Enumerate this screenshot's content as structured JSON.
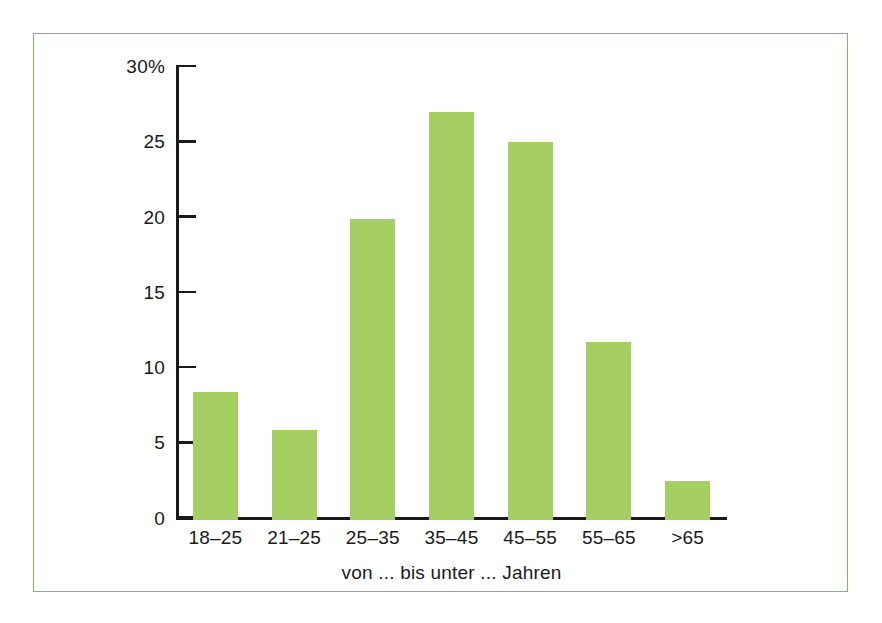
{
  "figure": {
    "frame_color": "#7cbf50",
    "background": "#ffffff"
  },
  "chart_data": {
    "type": "bar",
    "title": "",
    "subtitle": "",
    "xlabel": "von ... bis unter ... Jahren",
    "ylabel": "",
    "categories": [
      "18–25",
      "21–25",
      "25–35",
      "35–45",
      "45–55",
      "55–65",
      ">65"
    ],
    "values": [
      8.5,
      6.0,
      20.0,
      27.1,
      25.1,
      11.8,
      2.6
    ],
    "series": [
      {
        "name": "Anteil",
        "values": [
          8.5,
          6.0,
          20.0,
          27.1,
          25.1,
          11.8,
          2.6
        ]
      }
    ],
    "ylim": [
      0,
      30
    ],
    "ytick_values": [
      0,
      5,
      10,
      15,
      20,
      25,
      30
    ],
    "ytick_labels": [
      "0",
      "5",
      "10",
      "15",
      "20",
      "25",
      "30%"
    ],
    "grid": false,
    "legend": null,
    "bar_color": "#a5ce63",
    "axis_color": "#1a1a1a",
    "unit": "%"
  }
}
